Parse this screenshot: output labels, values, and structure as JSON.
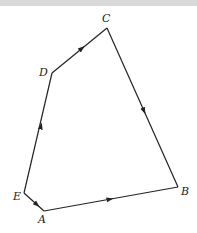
{
  "diagram": {
    "type": "polygon-vector-diagram",
    "colors": {
      "line": "#222222",
      "background": "#ffffff",
      "top_band": "#d9d9d9"
    },
    "vertices": [
      {
        "name": "A",
        "label": "A",
        "x": 44,
        "y": 211,
        "lx": 38,
        "ly": 223
      },
      {
        "name": "B",
        "label": "B",
        "x": 178,
        "y": 187,
        "lx": 181,
        "ly": 194
      },
      {
        "name": "C",
        "label": "C",
        "x": 107,
        "y": 28,
        "lx": 102,
        "ly": 21
      },
      {
        "name": "D",
        "label": "D",
        "x": 52,
        "y": 73,
        "lx": 40,
        "ly": 75
      },
      {
        "name": "E",
        "label": "E",
        "x": 24,
        "y": 193,
        "lx": 13,
        "ly": 199
      }
    ],
    "edges": [
      {
        "from": "E",
        "to": "A",
        "arrow": "toward A"
      },
      {
        "from": "A",
        "to": "B",
        "arrow": "toward B"
      },
      {
        "from": "C",
        "to": "B",
        "arrow": "toward B"
      },
      {
        "from": "D",
        "to": "C",
        "arrow": "toward C"
      },
      {
        "from": "E",
        "to": "D",
        "arrow": "toward D"
      }
    ]
  },
  "labels": {
    "A": "A",
    "B": "B",
    "C": "C",
    "D": "D",
    "E": "E"
  }
}
